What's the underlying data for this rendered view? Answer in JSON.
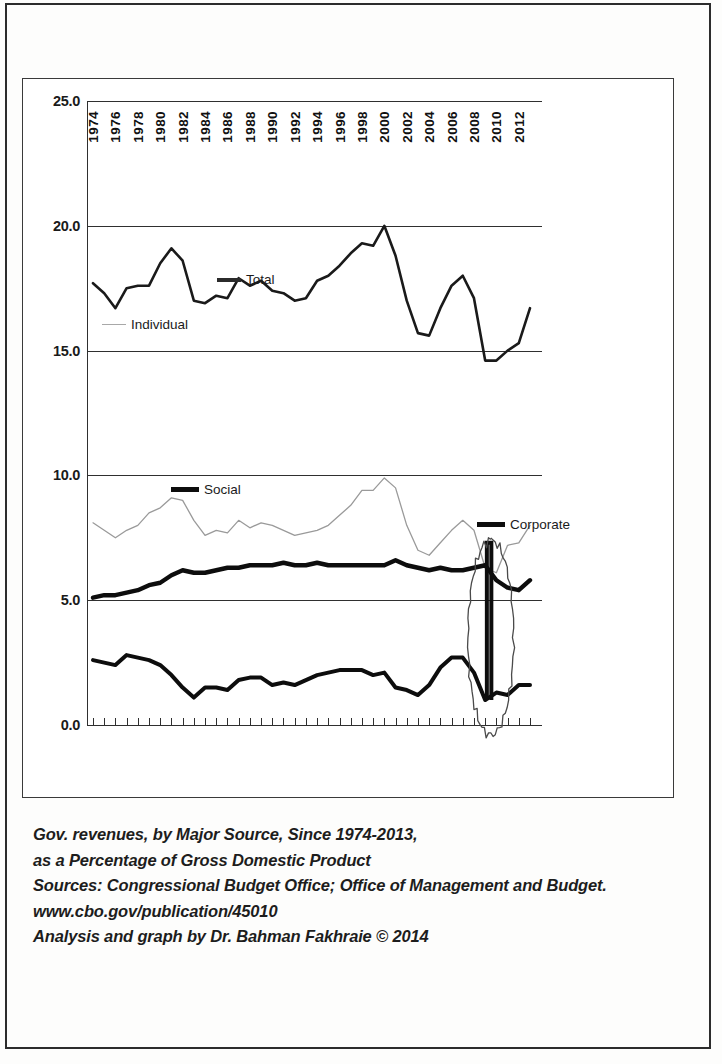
{
  "chart_data": {
    "type": "line",
    "title": "Gov. revenues, by Major Source, Since 1974-2013, as a Percentage of Gross Domestic Product",
    "xlabel": "",
    "ylabel": "",
    "ylim": [
      0.0,
      25.0
    ],
    "ytick_labels": [
      "25.0",
      "20.0",
      "15.0",
      "10.0",
      "5.0",
      "0.0"
    ],
    "ytick_values": [
      25.0,
      20.0,
      15.0,
      10.0,
      5.0,
      0.0
    ],
    "grid": true,
    "legend_position": "inside-plot",
    "x": [
      1974,
      1975,
      1976,
      1977,
      1978,
      1979,
      1980,
      1981,
      1982,
      1983,
      1984,
      1985,
      1986,
      1987,
      1988,
      1989,
      1990,
      1991,
      1992,
      1993,
      1994,
      1995,
      1996,
      1997,
      1998,
      1999,
      2000,
      2001,
      2002,
      2003,
      2004,
      2005,
      2006,
      2007,
      2008,
      2009,
      2010,
      2011,
      2012,
      2013
    ],
    "x_tick_labels": [
      "1974",
      "1976",
      "1978",
      "1980",
      "1982",
      "1984",
      "1986",
      "1988",
      "1990",
      "1992",
      "1994",
      "1996",
      "1998",
      "2000",
      "2002",
      "2004",
      "2006",
      "2008",
      "2010",
      "2012"
    ],
    "series": [
      {
        "name": "Total",
        "values": [
          17.7,
          17.3,
          16.7,
          17.5,
          17.6,
          17.6,
          18.5,
          19.1,
          18.6,
          17.0,
          16.9,
          17.2,
          17.1,
          17.9,
          17.6,
          17.8,
          17.4,
          17.3,
          17.0,
          17.1,
          17.8,
          18.0,
          18.4,
          18.9,
          19.3,
          19.2,
          20.0,
          18.8,
          17.0,
          15.7,
          15.6,
          16.7,
          17.6,
          18.0,
          17.1,
          14.6,
          14.6,
          15.0,
          15.3,
          16.7
        ],
        "color": "#1a1a1a",
        "linewidth": 2.6
      },
      {
        "name": "Individual",
        "values": [
          8.1,
          7.8,
          7.5,
          7.8,
          8.0,
          8.5,
          8.7,
          9.1,
          9.0,
          8.2,
          7.6,
          7.8,
          7.7,
          8.2,
          7.9,
          8.1,
          8.0,
          7.8,
          7.6,
          7.7,
          7.8,
          8.0,
          8.4,
          8.8,
          9.4,
          9.4,
          9.9,
          9.5,
          8.0,
          7.0,
          6.8,
          7.3,
          7.8,
          8.2,
          7.8,
          6.3,
          6.1,
          7.2,
          7.3,
          8.0
        ],
        "color": "#9a9a9a",
        "linewidth": 1.3
      },
      {
        "name": "Social",
        "values": [
          5.1,
          5.2,
          5.2,
          5.3,
          5.4,
          5.6,
          5.7,
          6.0,
          6.2,
          6.1,
          6.1,
          6.2,
          6.3,
          6.3,
          6.4,
          6.4,
          6.4,
          6.5,
          6.4,
          6.4,
          6.5,
          6.4,
          6.4,
          6.4,
          6.4,
          6.4,
          6.4,
          6.6,
          6.4,
          6.3,
          6.2,
          6.3,
          6.2,
          6.2,
          6.3,
          6.4,
          5.8,
          5.5,
          5.4,
          5.8
        ],
        "color": "#0d0d0d",
        "linewidth": 4.4
      },
      {
        "name": "Corporate",
        "values": [
          2.6,
          2.5,
          2.4,
          2.8,
          2.7,
          2.6,
          2.4,
          2.0,
          1.5,
          1.1,
          1.5,
          1.5,
          1.4,
          1.8,
          1.9,
          1.9,
          1.6,
          1.7,
          1.6,
          1.8,
          2.0,
          2.1,
          2.2,
          2.2,
          2.2,
          2.0,
          2.1,
          1.5,
          1.4,
          1.2,
          1.6,
          2.3,
          2.7,
          2.7,
          2.1,
          1.0,
          1.3,
          1.2,
          1.6,
          1.6
        ],
        "color": "#0d0d0d",
        "linewidth": 4.0
      }
    ],
    "annotations": [
      {
        "kind": "hand-drawn-ellipse",
        "label": "",
        "x_start": 2008,
        "x_end": 2011,
        "y_top": 7.4,
        "y_bottom": -0.4
      }
    ]
  },
  "legend": {
    "total": "Total",
    "individual": "Individual",
    "social": "Social",
    "corporate": "Corporate"
  },
  "caption": {
    "line1": "Gov. revenues, by Major Source, Since 1974-2013,",
    "line2": "as a Percentage of Gross Domestic Product",
    "line3": "Sources: Congressional Budget Office; Office of Management and Budget.",
    "line4": "www.cbo.gov/publication/45010",
    "line5": "Analysis and graph by Dr. Bahman Fakhraie © 2014"
  }
}
